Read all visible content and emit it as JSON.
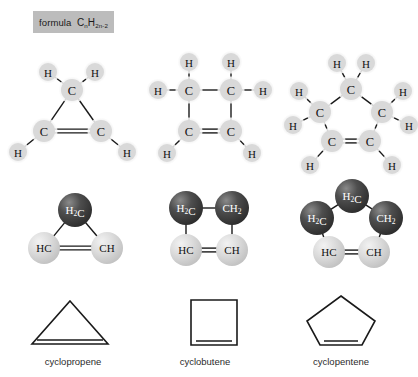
{
  "formula": {
    "label": "formula",
    "symbol_c": "C",
    "sub_c": "n",
    "symbol_h": "H",
    "sub_h": "2n-2",
    "full_text": "formula CnH2n-2",
    "box_color": "#bcbcbc"
  },
  "colors": {
    "atom_light": "#d9d9d9",
    "atom_light_halo": "#ebebeb",
    "atom_dark": "#3f3f3f",
    "atom_dark_highlight": "#6e6e6e",
    "bond": "#1a1a1a",
    "text_dark": "#111111",
    "text_light": "#ffffff",
    "background": "#ffffff"
  },
  "molecules": [
    {
      "name": "cyclopropene",
      "ring_size": 3,
      "lewis": {
        "carbons": [
          {
            "label": "C",
            "x": 72,
            "y": 90
          },
          {
            "label": "C",
            "x": 44,
            "y": 131
          },
          {
            "label": "C",
            "x": 101,
            "y": 131
          }
        ],
        "hydrogens": [
          {
            "label": "H",
            "x": 48,
            "y": 72,
            "bond_to": 0
          },
          {
            "label": "H",
            "x": 95,
            "y": 72,
            "bond_to": 0
          },
          {
            "label": "H",
            "x": 18,
            "y": 152,
            "bond_to": 1
          },
          {
            "label": "H",
            "x": 127,
            "y": 152,
            "bond_to": 2
          }
        ],
        "bonds": [
          {
            "from": 0,
            "to": 1,
            "order": 1
          },
          {
            "from": 0,
            "to": 2,
            "order": 1
          },
          {
            "from": 1,
            "to": 2,
            "order": 2
          }
        ]
      },
      "ball": {
        "atoms": [
          {
            "label": "H2C",
            "shade": "dark",
            "x": 75,
            "y": 210,
            "r": 17
          },
          {
            "label": "HC",
            "shade": "light",
            "x": 44,
            "y": 248,
            "r": 16
          },
          {
            "label": "CH",
            "shade": "light",
            "x": 107,
            "y": 248,
            "r": 16
          }
        ],
        "bonds": [
          {
            "from": 0,
            "to": 1,
            "order": 1
          },
          {
            "from": 0,
            "to": 2,
            "order": 1
          },
          {
            "from": 1,
            "to": 2,
            "order": 2
          }
        ]
      },
      "skeletal": {
        "shape": "triangle",
        "points": "70,301 108,344 32,344",
        "double_bond": {
          "x1": 37,
          "y1": 340,
          "x2": 103,
          "y2": 340
        }
      }
    },
    {
      "name": "cyclobutene",
      "ring_size": 4,
      "lewis": {
        "carbons": [
          {
            "label": "C",
            "x": 189,
            "y": 90
          },
          {
            "label": "C",
            "x": 231,
            "y": 90
          },
          {
            "label": "C",
            "x": 189,
            "y": 131
          },
          {
            "label": "C",
            "x": 231,
            "y": 131
          }
        ],
        "hydrogens": [
          {
            "label": "H",
            "x": 189,
            "y": 62,
            "bond_to": 0
          },
          {
            "label": "H",
            "x": 158,
            "y": 90,
            "bond_to": 0
          },
          {
            "label": "H",
            "x": 231,
            "y": 62,
            "bond_to": 1
          },
          {
            "label": "H",
            "x": 263,
            "y": 90,
            "bond_to": 1
          },
          {
            "label": "H",
            "x": 167,
            "y": 153,
            "bond_to": 2
          },
          {
            "label": "H",
            "x": 252,
            "y": 153,
            "bond_to": 3
          }
        ],
        "bonds": [
          {
            "from": 0,
            "to": 1,
            "order": 1
          },
          {
            "from": 0,
            "to": 2,
            "order": 1
          },
          {
            "from": 1,
            "to": 3,
            "order": 1
          },
          {
            "from": 2,
            "to": 3,
            "order": 2
          }
        ]
      },
      "ball": {
        "atoms": [
          {
            "label": "H2C",
            "shade": "dark",
            "x": 186,
            "y": 208,
            "r": 17
          },
          {
            "label": "CH2",
            "shade": "dark",
            "x": 232,
            "y": 208,
            "r": 17
          },
          {
            "label": "HC",
            "shade": "light",
            "x": 186,
            "y": 250,
            "r": 16
          },
          {
            "label": "CH",
            "shade": "light",
            "x": 232,
            "y": 250,
            "r": 16
          }
        ],
        "bonds": [
          {
            "from": 0,
            "to": 1,
            "order": 1
          },
          {
            "from": 0,
            "to": 2,
            "order": 1
          },
          {
            "from": 1,
            "to": 3,
            "order": 1
          },
          {
            "from": 2,
            "to": 3,
            "order": 2
          }
        ]
      },
      "skeletal": {
        "shape": "square",
        "points": "191,300 237,300 237,345 191,345",
        "double_bond": {
          "x1": 196,
          "y1": 341,
          "x2": 232,
          "y2": 341
        }
      }
    },
    {
      "name": "cyclopentene",
      "ring_size": 5,
      "lewis": {
        "carbons": [
          {
            "label": "C",
            "x": 351,
            "y": 89
          },
          {
            "label": "C",
            "x": 320,
            "y": 112
          },
          {
            "label": "C",
            "x": 382,
            "y": 112
          },
          {
            "label": "C",
            "x": 332,
            "y": 141
          },
          {
            "label": "C",
            "x": 370,
            "y": 141
          }
        ],
        "hydrogens": [
          {
            "label": "H",
            "x": 337,
            "y": 63,
            "bond_to": 0
          },
          {
            "label": "H",
            "x": 366,
            "y": 63,
            "bond_to": 0
          },
          {
            "label": "H",
            "x": 299,
            "y": 91,
            "bond_to": 1
          },
          {
            "label": "H",
            "x": 293,
            "y": 125,
            "bond_to": 1
          },
          {
            "label": "H",
            "x": 403,
            "y": 91,
            "bond_to": 2
          },
          {
            "label": "H",
            "x": 409,
            "y": 125,
            "bond_to": 2
          },
          {
            "label": "H",
            "x": 310,
            "y": 165,
            "bond_to": 3
          },
          {
            "label": "H",
            "x": 392,
            "y": 165,
            "bond_to": 4
          }
        ],
        "bonds": [
          {
            "from": 0,
            "to": 1,
            "order": 1
          },
          {
            "from": 0,
            "to": 2,
            "order": 1
          },
          {
            "from": 1,
            "to": 3,
            "order": 1
          },
          {
            "from": 2,
            "to": 4,
            "order": 1
          },
          {
            "from": 3,
            "to": 4,
            "order": 2
          }
        ]
      },
      "ball": {
        "atoms": [
          {
            "label": "H2C",
            "shade": "dark",
            "x": 352,
            "y": 196,
            "r": 17
          },
          {
            "label": "H2C",
            "shade": "dark",
            "x": 317,
            "y": 218,
            "r": 17
          },
          {
            "label": "CH2",
            "shade": "dark",
            "x": 386,
            "y": 218,
            "r": 17
          },
          {
            "label": "HC",
            "shade": "light",
            "x": 329,
            "y": 252,
            "r": 16
          },
          {
            "label": "CH",
            "shade": "light",
            "x": 374,
            "y": 252,
            "r": 16
          }
        ],
        "bonds": [
          {
            "from": 0,
            "to": 1,
            "order": 1
          },
          {
            "from": 0,
            "to": 2,
            "order": 1
          },
          {
            "from": 1,
            "to": 3,
            "order": 1
          },
          {
            "from": 2,
            "to": 4,
            "order": 1
          },
          {
            "from": 3,
            "to": 4,
            "order": 2
          }
        ]
      },
      "skeletal": {
        "shape": "pentagon",
        "points": "341,296 375,321 362,345 320,345 307,321",
        "double_bond": {
          "x1": 324,
          "y1": 341,
          "x2": 358,
          "y2": 341
        }
      }
    }
  ]
}
